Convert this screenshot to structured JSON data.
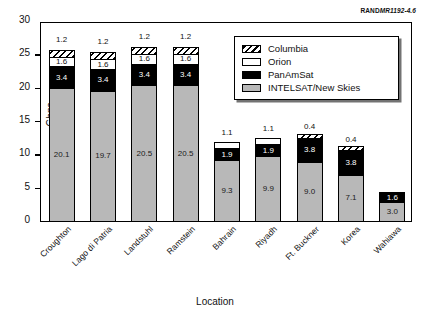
{
  "source_credit": {
    "prefix": "RAND",
    "number": "MR1192-4.6"
  },
  "chart_data": {
    "type": "bar",
    "subtype": "stacked-bar",
    "title": "",
    "xlabel": "Location",
    "ylabel": "Gbps",
    "ylim": [
      0,
      30
    ],
    "yticks": [
      0,
      5,
      10,
      15,
      20,
      25,
      30
    ],
    "ytick_labels": [
      "0",
      "5",
      "10",
      "15",
      "20",
      "25",
      "30"
    ],
    "grid": false,
    "legend_position": "upper-right-inside",
    "categories": [
      "Croughton",
      "Lago di Patria",
      "Landstuhl",
      "Ramstein",
      "Bahrain",
      "Riyadh",
      "Ft. Buckner",
      "Korea",
      "Wahiawa"
    ],
    "series": [
      {
        "name": "INTELSAT/New Skies",
        "color": "#b8b8b8",
        "values": [
          20.1,
          19.7,
          20.5,
          20.5,
          9.3,
          9.9,
          9.0,
          7.1,
          3.0
        ]
      },
      {
        "name": "PanAmSat",
        "color": "#000000",
        "values": [
          3.4,
          3.4,
          3.4,
          3.4,
          1.9,
          1.9,
          3.8,
          3.8,
          1.6
        ]
      },
      {
        "name": "Orion",
        "color": "#ffffff",
        "values": [
          1.6,
          1.6,
          1.6,
          1.6,
          1.1,
          1.1,
          0.0,
          0.0,
          0.0
        ]
      },
      {
        "name": "Columbia",
        "color": "hatched",
        "values": [
          1.2,
          1.2,
          1.2,
          1.2,
          0.0,
          0.0,
          0.4,
          0.4,
          0.0
        ]
      }
    ],
    "totals": [
      26.3,
      25.9,
      26.7,
      26.7,
      12.3,
      12.9,
      13.2,
      11.3,
      4.6
    ],
    "legend_entries": [
      "Columbia",
      "Orion",
      "PanAmSat",
      "INTELSAT/New Skies"
    ]
  }
}
